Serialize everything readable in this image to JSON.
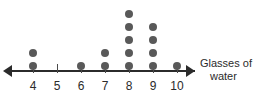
{
  "chart_data": {
    "type": "scatter",
    "plot_style": "dot-plot",
    "title": "",
    "xlabel": "Glasses of water",
    "ylabel": "",
    "categories": [
      "4",
      "5",
      "6",
      "7",
      "8",
      "9",
      "10"
    ],
    "values": [
      2,
      0,
      1,
      2,
      5,
      4,
      1
    ],
    "x": [
      4,
      5,
      6,
      7,
      8,
      9,
      10
    ],
    "xlim": [
      4,
      10
    ],
    "ylim": [
      0,
      5
    ],
    "grid": false,
    "legend": null,
    "axis_arrows": "both",
    "dot_color": "#595959",
    "axis_color": "#2b2b2b"
  },
  "axis": {
    "caption_line1": "Glasses of",
    "caption_line2": "water"
  }
}
